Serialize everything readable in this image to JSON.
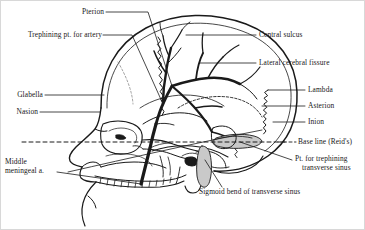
{
  "figure": {
    "type": "anatomical-diagram",
    "view": "left lateral",
    "ink_color": "#1a1a1a",
    "background_color": "#ffffff",
    "sinus_shading_color": "#c9c9c9"
  },
  "labels": {
    "pterion": "Pterion",
    "trephining_artery": "Trephining pt. for artery",
    "glabella": "Glabella",
    "nasion": "Nasion",
    "middle_meningeal_line1": "Middle",
    "middle_meningeal_line2": "meningeal a.",
    "central_sulcus": "Central sulcus",
    "lateral_cerebral_fissure": "Lateral cerebral fissure",
    "lambda": "Lambda",
    "asterion": "Asterion",
    "inion": "Inion",
    "base_line": "Base line (Reid's)",
    "trephining_sinus_line1": "Pt. for trephining",
    "trephining_sinus_line2": "transverse sinus",
    "sigmoid_bend": "Sigmoid bend of transverse sinus"
  }
}
